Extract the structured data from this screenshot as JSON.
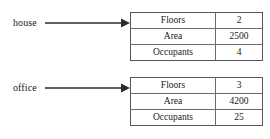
{
  "diagram": {
    "colors": {
      "background": "#ffffff",
      "text": "#1a1a1a",
      "table_border": "#6b6b6b",
      "table_outer_border": "#555555",
      "arrow": "#2b2b2b"
    },
    "objects": [
      {
        "label": "house",
        "arrow_icon": "arrow-right-icon",
        "rows": [
          {
            "name": "Floors",
            "value": "2"
          },
          {
            "name": "Area",
            "value": "2500"
          },
          {
            "name": "Occupants",
            "value": "4"
          }
        ]
      },
      {
        "label": "office",
        "arrow_icon": "arrow-right-icon",
        "rows": [
          {
            "name": "Floors",
            "value": "3"
          },
          {
            "name": "Area",
            "value": "4200"
          },
          {
            "name": "Occupants",
            "value": "25"
          }
        ]
      }
    ]
  }
}
